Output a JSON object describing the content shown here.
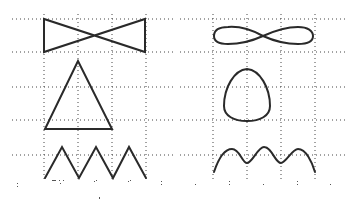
{
  "figure": {
    "colors": {
      "background": "#ffffff",
      "stroke": "#2a2a2a",
      "grid": "#444444"
    },
    "left_panel": {
      "grid_x": [
        44,
        78,
        112,
        146
      ],
      "grid_y": [
        19,
        52,
        87,
        120,
        155
      ],
      "shapes": [
        {
          "name": "bowtie",
          "label": ""
        },
        {
          "name": "triangle",
          "label": ""
        },
        {
          "name": "zigzag",
          "label": ""
        }
      ]
    },
    "right_panel": {
      "grid_x": [
        213,
        247,
        281,
        315
      ],
      "grid_y": [
        19,
        52,
        87,
        120,
        155
      ],
      "shapes": [
        {
          "name": "figure-eight",
          "label": ""
        },
        {
          "name": "egg-loop",
          "label": ""
        },
        {
          "name": "wave",
          "label": ""
        }
      ]
    }
  }
}
